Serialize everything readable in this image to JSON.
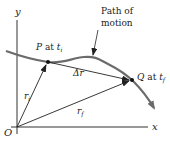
{
  "diagram": {
    "axes": {
      "x_label": "x",
      "y_label": "y",
      "origin_label": "O"
    },
    "path_label_line1": "Path of",
    "path_label_line2": "motion",
    "point_p": {
      "name": "P",
      "at": "at",
      "time": "t",
      "time_sub": "i"
    },
    "point_q": {
      "name": "Q",
      "at": "at",
      "time": "t",
      "time_sub": "f"
    },
    "vectors": {
      "r_initial": {
        "symbol": "r",
        "sub": "i"
      },
      "r_final": {
        "symbol": "r",
        "sub": "f"
      },
      "displacement": {
        "symbol": "Δr"
      }
    },
    "colors": {
      "path": "#6b6b6b",
      "vector": "#222222",
      "axis": "#333333"
    }
  }
}
